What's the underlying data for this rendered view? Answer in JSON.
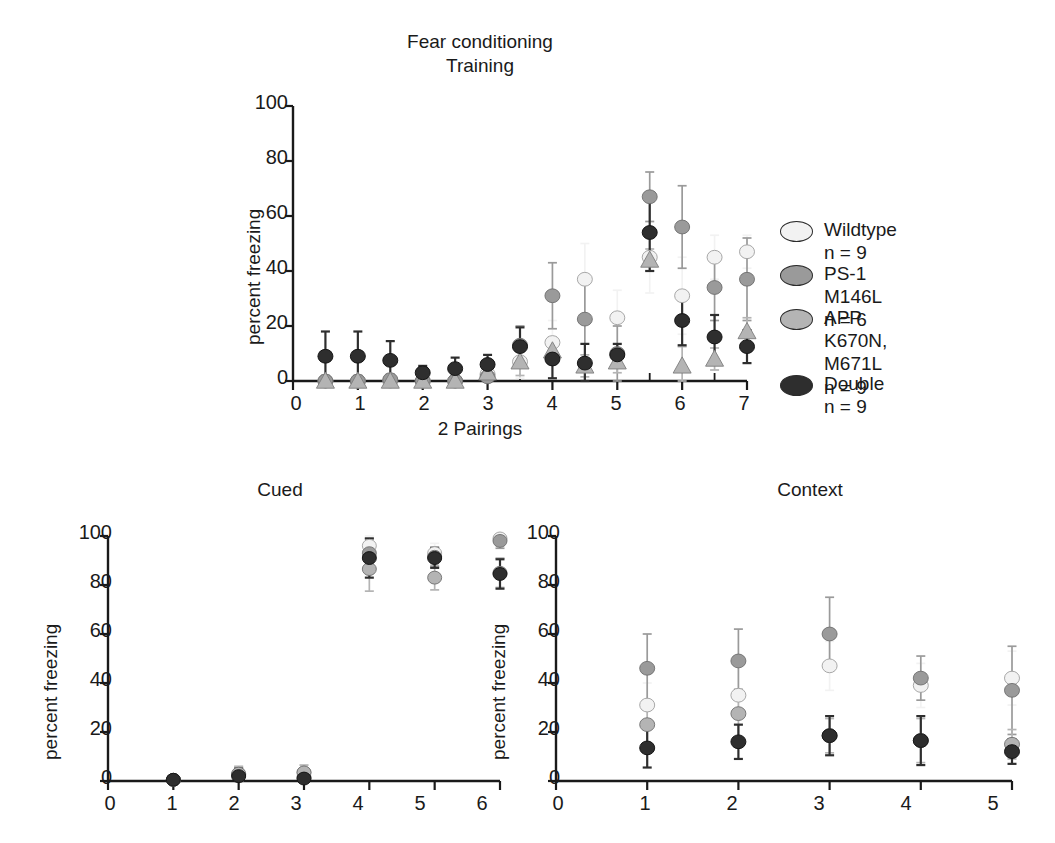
{
  "figure": {
    "title": "Fear conditioning\nTraining",
    "background": "#ffffff"
  },
  "legend": {
    "items": [
      {
        "label": "Wildtype n = 9",
        "color": "#f2f2f2",
        "series": "wildtype"
      },
      {
        "label": "PS-1 M146L n = 6",
        "color": "#9a9a9a",
        "series": "ps1"
      },
      {
        "label": "APP K670N,\nM671L n = 9",
        "color": "#b4b4b4",
        "series": "app"
      },
      {
        "label": "Double n = 9",
        "color": "#2e2e2e",
        "series": "double"
      }
    ]
  },
  "colors": {
    "wildtype": "#f2f2f2",
    "ps1": "#9a9a9a",
    "app": "#b4b4b4",
    "double": "#2e2e2e",
    "axis": "#1a1a1a"
  },
  "chart_data": [
    {
      "type": "scatter",
      "panel": "training",
      "title": "Fear conditioning\nTraining",
      "xlabel": "2 Pairings",
      "ylabel": "percent freezing",
      "xlim": [
        0,
        7
      ],
      "ylim": [
        0,
        100
      ],
      "xticks": [
        0,
        1,
        2,
        3,
        4,
        5,
        6,
        7
      ],
      "yticks": [
        0,
        20,
        40,
        60,
        80,
        100
      ],
      "minor_xticks": [
        0.5,
        1.5,
        2.5,
        3.5,
        4.5,
        5.5,
        6.5
      ],
      "grid": false,
      "legend_position": "right",
      "x": [
        0.5,
        1,
        1.5,
        2,
        2.5,
        3,
        3.5,
        4,
        4.5,
        5,
        5.5,
        6,
        6.5,
        7
      ],
      "series": [
        {
          "name": "Wildtype",
          "values": [
            0,
            0,
            0,
            0,
            0,
            2.5,
            7,
            14,
            37,
            23,
            45,
            31,
            45,
            47
          ],
          "errors": [
            2,
            2,
            2,
            1.5,
            1.5,
            3,
            6,
            8,
            13,
            10,
            13,
            14,
            8,
            6
          ]
        },
        {
          "name": "PS-1 M146L",
          "values": [
            0,
            0,
            0.5,
            0,
            0,
            1.5,
            13,
            31,
            22.5,
            10,
            67,
            56,
            34,
            37
          ],
          "errors": [
            2,
            2,
            2,
            1.5,
            1.5,
            3,
            7,
            12,
            16,
            10,
            9,
            15,
            12,
            15
          ]
        },
        {
          "name": "APP K670N, M671L",
          "values": [
            0,
            0,
            0,
            0,
            0,
            3,
            7,
            11,
            5.5,
            7,
            44,
            5.5,
            8,
            18
          ],
          "errors": [
            2,
            2,
            2,
            1.5,
            1.5,
            3,
            5,
            5,
            4,
            4,
            4,
            7,
            4,
            5
          ]
        },
        {
          "name": "Double",
          "values": [
            9,
            9,
            7.5,
            3,
            4.5,
            6,
            12.5,
            8,
            6.5,
            9.5,
            54,
            22,
            16,
            12.5
          ],
          "errors": [
            9,
            9,
            7,
            2.5,
            4,
            3.5,
            7,
            7,
            7,
            4,
            14,
            9,
            8,
            6
          ]
        }
      ]
    },
    {
      "type": "scatter",
      "panel": "cued",
      "title": "Cued",
      "xlabel": "",
      "ylabel": "percent freezing",
      "xlim": [
        0,
        6
      ],
      "ylim": [
        0,
        100
      ],
      "xticks": [
        0,
        1,
        2,
        3,
        4,
        5,
        6
      ],
      "yticks": [
        0,
        20,
        40,
        60,
        80,
        100
      ],
      "grid": false,
      "x": [
        1,
        2,
        3,
        4,
        5,
        6
      ],
      "series": [
        {
          "name": "Wildtype",
          "values": [
            0.5,
            2.5,
            3.5,
            96,
            93,
            99
          ],
          "errors": [
            1,
            3,
            3,
            5,
            4,
            3
          ]
        },
        {
          "name": "PS-1 M146L",
          "values": [
            0.5,
            2.5,
            1.5,
            93,
            91.5,
            98
          ],
          "errors": [
            1,
            3,
            2,
            6,
            4,
            3
          ]
        },
        {
          "name": "APP K670N, M671L",
          "values": [
            0.5,
            3,
            3.5,
            86.5,
            83,
            85
          ],
          "errors": [
            1,
            3,
            3,
            9,
            5,
            6
          ]
        },
        {
          "name": "Double",
          "values": [
            0.5,
            2,
            1,
            91,
            91,
            84.5
          ],
          "errors": [
            1,
            3,
            2,
            8,
            4,
            6
          ]
        }
      ]
    },
    {
      "type": "scatter",
      "panel": "context",
      "title": "Context",
      "xlabel": "",
      "ylabel": "percent freezing",
      "xlim": [
        0,
        5
      ],
      "ylim": [
        0,
        100
      ],
      "xticks": [
        0,
        1,
        2,
        3,
        4,
        5
      ],
      "yticks": [
        0,
        20,
        40,
        60,
        80,
        100
      ],
      "grid": false,
      "x": [
        1,
        2,
        3,
        4,
        5
      ],
      "series": [
        {
          "name": "Wildtype",
          "values": [
            31,
            35,
            47,
            39,
            42
          ],
          "errors": [
            9,
            12,
            10,
            9,
            11
          ]
        },
        {
          "name": "PS-1 M146L",
          "values": [
            46,
            49,
            60,
            42,
            37
          ],
          "errors": [
            14,
            13,
            15,
            9,
            18
          ]
        },
        {
          "name": "APP K670N, M671L",
          "values": [
            23,
            27.5,
            18.5,
            16.5,
            15
          ],
          "errors": [
            8,
            10,
            7,
            9,
            6
          ]
        },
        {
          "name": "Double",
          "values": [
            13.5,
            16,
            18.5,
            16.5,
            12
          ],
          "errors": [
            8,
            7,
            8,
            10,
            5
          ]
        }
      ]
    }
  ]
}
